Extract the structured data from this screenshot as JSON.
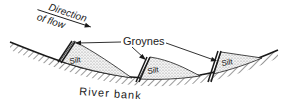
{
  "figure": {
    "type": "diagram",
    "colors": {
      "ink": "#1a1a1a",
      "silt_fill": "#e6e6e6",
      "background": "#ffffff"
    }
  },
  "labels": {
    "direction_line1": "Direction",
    "direction_line2": "of flow",
    "groynes": "Groynes",
    "silt": "Silt",
    "river_bank": "River bank"
  },
  "groynes": [
    {
      "id": 1,
      "silt_label": "Silt"
    },
    {
      "id": 2,
      "silt_label": "Silt"
    },
    {
      "id": 3,
      "silt_label": "Silt"
    }
  ]
}
